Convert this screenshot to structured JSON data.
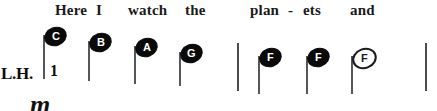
{
  "score": {
    "hand_label": "L.H.",
    "fingering": "1",
    "dynamic": "m",
    "lyrics": [
      {
        "text": "Here",
        "x": 55
      },
      {
        "text": "I",
        "x": 96
      },
      {
        "text": "watch",
        "x": 128
      },
      {
        "text": "the",
        "x": 185
      },
      {
        "text": "plan",
        "x": 250
      },
      {
        "text": "-",
        "x": 288
      },
      {
        "text": "ets",
        "x": 303
      },
      {
        "text": "and",
        "x": 350
      }
    ],
    "notes": [
      {
        "pitch": "C",
        "x": 40,
        "y": 27,
        "stem": 44,
        "head": "filled"
      },
      {
        "pitch": "B",
        "x": 85,
        "y": 33,
        "stem": 40,
        "head": "filled"
      },
      {
        "pitch": "A",
        "x": 131,
        "y": 38,
        "stem": 38,
        "head": "filled"
      },
      {
        "pitch": "G",
        "x": 176,
        "y": 44,
        "stem": 34,
        "head": "filled"
      },
      {
        "pitch": "F",
        "x": 255,
        "y": 48,
        "stem": 38,
        "head": "filled"
      },
      {
        "pitch": "F",
        "x": 303,
        "y": 48,
        "stem": 38,
        "head": "filled"
      },
      {
        "pitch": "F",
        "x": 348,
        "y": 48,
        "stem": 38,
        "head": "hollow"
      }
    ],
    "barlines": [
      {
        "x": 237,
        "y": 43,
        "height": 48
      },
      {
        "x": 425,
        "y": 43,
        "height": 48
      }
    ],
    "colors": {
      "ink": "#0a0a0a",
      "stem": "#55575a",
      "paper": "#ffffff"
    }
  }
}
